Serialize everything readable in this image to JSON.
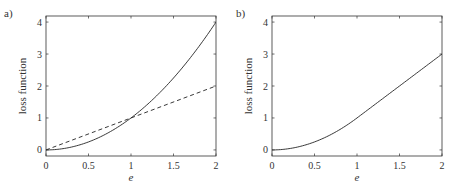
{
  "chart_data": [
    {
      "panel_label": "a)",
      "type": "line",
      "title": "",
      "xlabel": "e",
      "ylabel": "loss function",
      "xlim": [
        0,
        2
      ],
      "ylim": [
        -0.19,
        4.19
      ],
      "xticks": [
        "0",
        "0.5",
        "1",
        "1.5",
        "2"
      ],
      "yticks": [
        "0",
        "1",
        "2",
        "3",
        "4"
      ],
      "grid": false,
      "legend": null,
      "series": [
        {
          "name": "squared loss",
          "style": "solid",
          "x": [
            0,
            0.25,
            0.5,
            0.75,
            1,
            1.25,
            1.5,
            1.75,
            2
          ],
          "values": [
            0,
            0.0625,
            0.25,
            0.5625,
            1,
            1.5625,
            2.25,
            3.0625,
            4
          ]
        },
        {
          "name": "absolute loss",
          "style": "dashed",
          "x": [
            0,
            2
          ],
          "values": [
            0,
            2
          ]
        }
      ]
    },
    {
      "panel_label": "b)",
      "type": "line",
      "title": "",
      "xlabel": "e",
      "ylabel": "loss function",
      "xlim": [
        0,
        2
      ],
      "ylim": [
        -0.19,
        4.19
      ],
      "xticks": [
        "0",
        "0.5",
        "1",
        "1.5",
        "2"
      ],
      "yticks": [
        "0",
        "1",
        "2",
        "3",
        "4"
      ],
      "grid": false,
      "legend": null,
      "series": [
        {
          "name": "huber loss",
          "style": "solid",
          "x": [
            0,
            0.25,
            0.5,
            0.75,
            1,
            1.25,
            1.5,
            1.75,
            2
          ],
          "values": [
            0,
            0.0625,
            0.25,
            0.5625,
            1,
            1.5,
            2,
            2.5,
            3
          ]
        }
      ]
    }
  ]
}
